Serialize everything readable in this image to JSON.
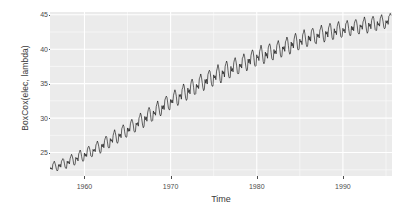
{
  "chart_data": {
    "type": "line",
    "title": "",
    "subtitle": "",
    "xlabel": "Time",
    "ylabel": "BoxCox(elec, lambda)",
    "xlim": [
      1956.0,
      1995.7
    ],
    "ylim": [
      21.6,
      45.4
    ],
    "xticks": [
      1960,
      1970,
      1980,
      1990
    ],
    "xtick_labels": [
      "1960",
      "1970",
      "1980",
      "1990"
    ],
    "yticks": [
      25,
      30,
      35,
      40,
      45
    ],
    "ytick_labels": [
      "25",
      "30",
      "35",
      "40",
      "45"
    ],
    "grid": true,
    "grid_major_color": "#ffffff",
    "grid_minor_color": "#f7f7f7",
    "panel_background": "#ebebeb",
    "legend_position": "none",
    "series": [
      {
        "name": "BoxCox(elec, lambda)",
        "color": "#000000",
        "linewidth": 0.6,
        "x_start": 1956.0,
        "x_step": 0.08333333,
        "seasonal_pattern": [
          0.55,
          0.05,
          0.35,
          -0.25,
          0.95,
          1.25,
          1.55,
          1.15,
          0.35,
          -0.55,
          -0.85,
          -0.75
        ],
        "trend_anchors": [
          {
            "x": 1956.0,
            "y": 22.55
          },
          {
            "x": 1958.0,
            "y": 23.35
          },
          {
            "x": 1960.0,
            "y": 24.45
          },
          {
            "x": 1962.0,
            "y": 25.75
          },
          {
            "x": 1964.0,
            "y": 27.25
          },
          {
            "x": 1966.0,
            "y": 28.85
          },
          {
            "x": 1968.0,
            "y": 30.45
          },
          {
            "x": 1970.0,
            "y": 32.15
          },
          {
            "x": 1972.0,
            "y": 33.65
          },
          {
            "x": 1974.0,
            "y": 35.05
          },
          {
            "x": 1976.0,
            "y": 36.25
          },
          {
            "x": 1978.0,
            "y": 37.35
          },
          {
            "x": 1980.0,
            "y": 38.55
          },
          {
            "x": 1982.0,
            "y": 39.35
          },
          {
            "x": 1984.0,
            "y": 40.35
          },
          {
            "x": 1986.0,
            "y": 41.35
          },
          {
            "x": 1988.0,
            "y": 42.05
          },
          {
            "x": 1990.0,
            "y": 42.55
          },
          {
            "x": 1992.0,
            "y": 43.05
          },
          {
            "x": 1994.0,
            "y": 43.45
          },
          {
            "x": 1995.7,
            "y": 43.95
          }
        ],
        "amplitude_anchors": [
          {
            "x": 1956.0,
            "a": 0.62
          },
          {
            "x": 1965.0,
            "a": 0.92
          },
          {
            "x": 1975.0,
            "a": 1.12
          },
          {
            "x": 1985.0,
            "a": 1.08
          },
          {
            "x": 1995.7,
            "a": 0.88
          }
        ],
        "y_first": 22.1,
        "y_last": 44.9,
        "n_points": 476
      }
    ]
  },
  "axes": {
    "y_title": "BoxCox(elec, lambda)",
    "x_title": "Time"
  }
}
